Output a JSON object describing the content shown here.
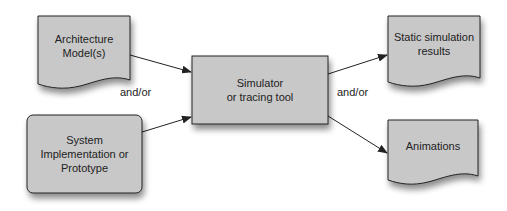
{
  "diagram": {
    "colors": {
      "fill": "#c8c8c8",
      "stroke": "#222222",
      "shadow": "#9a9a9a",
      "text": "#222222"
    },
    "nodes": {
      "architecture": {
        "label_line1": "Architecture",
        "label_line2": "Model(s)",
        "shape": "document"
      },
      "system": {
        "label_line1": "System",
        "label_line2": "Implementation or",
        "label_line3": "Prototype",
        "shape": "rounded-rect"
      },
      "simulator": {
        "label_line1": "Simulator",
        "label_line2": "or tracing tool",
        "shape": "rect"
      },
      "static_results": {
        "label_line1": "Static simulation",
        "label_line2": "results",
        "shape": "document"
      },
      "animations": {
        "label_line1": "Animations",
        "shape": "document"
      }
    },
    "edge_labels": {
      "left": "and/or",
      "right": "and/or"
    },
    "edges": [
      {
        "from": "architecture",
        "to": "simulator"
      },
      {
        "from": "system",
        "to": "simulator"
      },
      {
        "from": "simulator",
        "to": "static_results"
      },
      {
        "from": "simulator",
        "to": "animations"
      }
    ]
  }
}
